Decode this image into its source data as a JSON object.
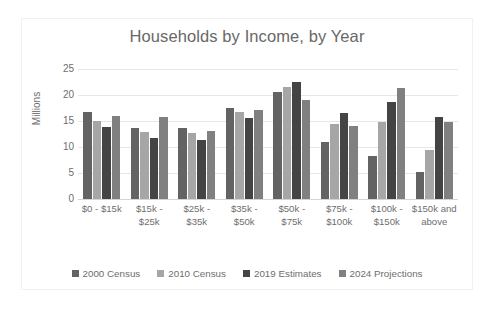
{
  "chart_data": {
    "type": "bar",
    "title": "Households by Income, by Year",
    "xlabel": "",
    "ylabel": "Millions",
    "ylim": [
      0,
      25
    ],
    "yticks": [
      25,
      20,
      15,
      10,
      5,
      0
    ],
    "grid": true,
    "legend_position": "bottom",
    "categories": [
      "$0 - $15k",
      "$15k - $25k",
      "$25k - $35k",
      "$35k - $50k",
      "$50k - $75k",
      "$75k - $100k",
      "$100k - $150k",
      "$150k and above"
    ],
    "series": [
      {
        "name": "2000 Census",
        "color": "#636363",
        "values": [
          16.8,
          13.6,
          13.6,
          17.5,
          20.6,
          11.0,
          8.3,
          5.1
        ]
      },
      {
        "name": "2010 Census",
        "color": "#a6a6a6",
        "values": [
          15.0,
          12.9,
          12.6,
          16.8,
          21.6,
          14.4,
          14.8,
          9.4
        ]
      },
      {
        "name": "2019 Estimates",
        "color": "#444444",
        "values": [
          13.9,
          11.7,
          11.4,
          15.6,
          22.5,
          16.5,
          18.7,
          15.8
        ]
      },
      {
        "name": "2024 Projections",
        "color": "#808080",
        "values": [
          15.9,
          15.8,
          13.1,
          17.1,
          19.0,
          14.0,
          21.4,
          14.8
        ]
      }
    ]
  },
  "axis": {
    "y_title": "Millions"
  }
}
